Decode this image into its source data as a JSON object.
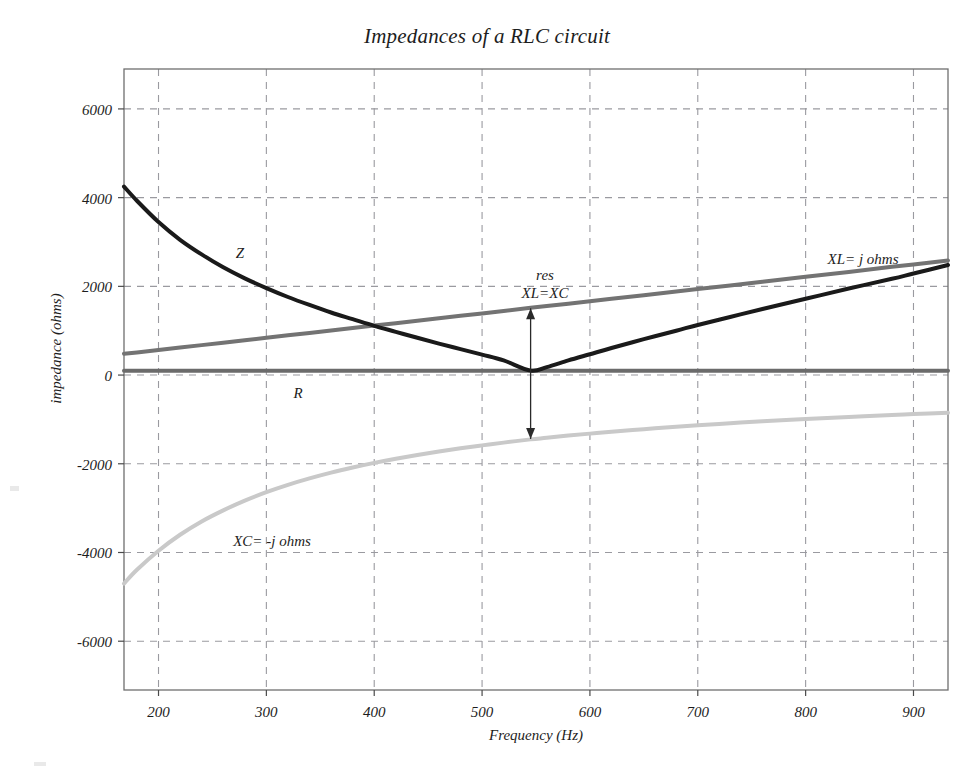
{
  "figure": {
    "background": "#ffffff",
    "title": "Impedances of a RLC circuit"
  },
  "axes": {
    "xlabel": "Frequency (Hz)",
    "ylabel": "impedance (ohms)",
    "x_ticks": [
      "200",
      "300",
      "400",
      "500",
      "600",
      "700",
      "800",
      "900"
    ],
    "y_ticks": [
      "6000",
      "4000",
      "2000",
      "0",
      "-2000",
      "-4000",
      "-6000"
    ],
    "grid": "dashed",
    "grid_color": "#9a9aa0",
    "frame_color": "#6f6f6f"
  },
  "annotations": {
    "resonance_line1": "res",
    "resonance_line2": "XL=XC",
    "z_label": "Z",
    "r_label": "R",
    "xl_label": "XL= j ohms",
    "xc_label": "XC= -j ohms"
  },
  "chart_data": {
    "type": "line",
    "title": "Impedances of a RLC circuit",
    "xlabel": "Frequency (Hz)",
    "ylabel": "impedance (ohms)",
    "xlim": [
      168,
      932
    ],
    "ylim": [
      -7100,
      6900
    ],
    "xticks": [
      200,
      300,
      400,
      500,
      600,
      700,
      800,
      900
    ],
    "yticks": [
      -6000,
      -4000,
      -2000,
      0,
      2000,
      4000,
      6000
    ],
    "grid": true,
    "legend": "inline-labels",
    "resonance_frequency_hz": 545,
    "resonance_value_ohms": 1380,
    "x": [
      168,
      180,
      200,
      220,
      240,
      260,
      280,
      300,
      320,
      340,
      360,
      380,
      400,
      420,
      440,
      460,
      480,
      500,
      520,
      545,
      560,
      580,
      600,
      620,
      650,
      680,
      700,
      730,
      760,
      800,
      840,
      880,
      900,
      932
    ],
    "series": [
      {
        "name": "Z",
        "label": "Z",
        "color": "#1a1a1a",
        "width": 4,
        "values": [
          4250,
          3930,
          3450,
          3050,
          2720,
          2430,
          2180,
          1960,
          1760,
          1580,
          1410,
          1260,
          1110,
          975,
          840,
          710,
          585,
          460,
          330,
          100,
          180,
          330,
          470,
          610,
          810,
          1000,
          1130,
          1310,
          1490,
          1720,
          1950,
          2170,
          2290,
          2480
        ]
      },
      {
        "name": "XL",
        "label": "XL= j ohms",
        "color": "#737373",
        "width": 4,
        "values": [
          480,
          510,
          565,
          620,
          675,
          730,
          785,
          840,
          895,
          950,
          1005,
          1060,
          1115,
          1170,
          1225,
          1280,
          1335,
          1390,
          1445,
          1515,
          1555,
          1610,
          1665,
          1720,
          1800,
          1885,
          1940,
          2020,
          2105,
          2215,
          2325,
          2440,
          2495,
          2585
        ]
      },
      {
        "name": "R",
        "label": "R",
        "color": "#6b6b6b",
        "width": 4,
        "values": [
          100,
          100,
          100,
          100,
          100,
          100,
          100,
          100,
          100,
          100,
          100,
          100,
          100,
          100,
          100,
          100,
          100,
          100,
          100,
          100,
          100,
          100,
          100,
          100,
          100,
          100,
          100,
          100,
          100,
          100,
          100,
          100,
          100,
          100
        ]
      },
      {
        "name": "XC",
        "label": "XC= -j ohms",
        "color": "#c9c9c9",
        "width": 4,
        "values": [
          -4700,
          -4390,
          -3960,
          -3600,
          -3300,
          -3050,
          -2830,
          -2640,
          -2475,
          -2330,
          -2200,
          -2085,
          -1980,
          -1885,
          -1800,
          -1722,
          -1650,
          -1585,
          -1523,
          -1450,
          -1415,
          -1365,
          -1320,
          -1278,
          -1220,
          -1165,
          -1132,
          -1085,
          -1043,
          -990,
          -943,
          -900,
          -880,
          -850
        ]
      }
    ],
    "arrow_annotation": {
      "x_hz": 545,
      "from_ohms": 1505,
      "to_ohms": -1440,
      "double_headed": true,
      "color": "#2a2a2a"
    }
  }
}
